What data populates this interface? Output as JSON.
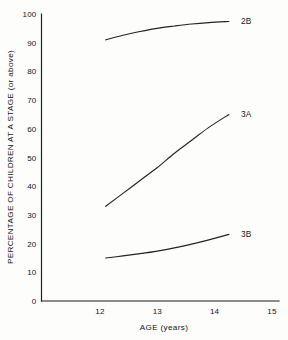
{
  "chart_data": {
    "type": "line",
    "title": "",
    "xlabel": "AGE (years)",
    "ylabel": "PERCENTAGE OF CHILDREN AT A STAGE (or above)",
    "xlim": [
      11.35,
      15.45
    ],
    "ylim": [
      0,
      100
    ],
    "x_ticks": [
      12,
      13,
      14,
      15
    ],
    "x_tick_labels": [
      "12",
      "13",
      "14",
      "15"
    ],
    "y_ticks": [
      0,
      10,
      20,
      30,
      40,
      50,
      60,
      70,
      80,
      90,
      100
    ],
    "y_tick_labels": [
      "0",
      "10",
      "20",
      "30",
      "40",
      "50",
      "60",
      "70",
      "80",
      "90",
      "100"
    ],
    "grid": false,
    "legend_position": "right-of-curve-end",
    "line_color": "#232323",
    "axis_color": "#1b1b1b",
    "background_color": "#fdfdfc",
    "series": [
      {
        "name": "2B",
        "label": "2B",
        "x": [
          12.1,
          12.4,
          12.7,
          13.0,
          13.3,
          13.6,
          13.9,
          14.25
        ],
        "values": [
          91.0,
          92.6,
          93.9,
          95.0,
          95.8,
          96.5,
          97.0,
          97.4
        ]
      },
      {
        "name": "3A",
        "label": "3A",
        "x": [
          12.1,
          12.4,
          12.7,
          13.0,
          13.3,
          13.6,
          13.9,
          14.25
        ],
        "values": [
          33.0,
          37.5,
          42.0,
          46.5,
          51.5,
          56.0,
          60.5,
          65.0
        ]
      },
      {
        "name": "3B",
        "label": "3B",
        "x": [
          12.1,
          12.4,
          12.7,
          13.0,
          13.3,
          13.6,
          13.9,
          14.25
        ],
        "values": [
          15.0,
          15.7,
          16.5,
          17.4,
          18.5,
          19.8,
          21.3,
          23.2
        ]
      }
    ]
  }
}
